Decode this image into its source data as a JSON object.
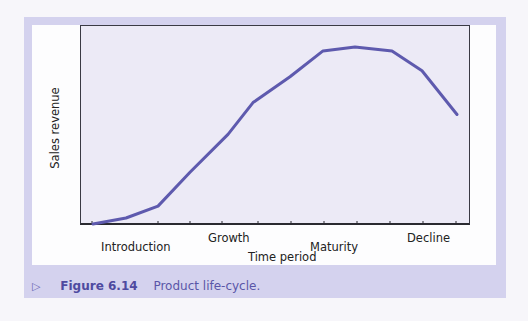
{
  "figure": {
    "number_label": "Figure 6.14",
    "title": "Product life-cycle.",
    "arrow_glyph": "▷"
  },
  "colors": {
    "frame": "#d4d2ee",
    "plot_bg": "#eceaf6",
    "curve": "#5e5aae",
    "caption": "#5a56a8"
  },
  "chart_data": {
    "type": "line",
    "title": "Product life-cycle",
    "xlabel": "Time period",
    "ylabel": "Sales revenue",
    "stages": [
      "Introduction",
      "Growth",
      "Maturity",
      "Decline"
    ],
    "x_ticks_count": 11,
    "grid": false,
    "legend": "none",
    "series": [
      {
        "name": "Sales revenue",
        "x": [
          0,
          1,
          2,
          3,
          4,
          5,
          6,
          7,
          8,
          9,
          10,
          11
        ],
        "values": [
          0,
          3,
          9,
          26,
          45,
          61,
          74,
          87,
          89,
          87,
          77,
          55
        ]
      }
    ],
    "ylim": [
      0,
      100
    ]
  },
  "labels": {
    "ylabel": "Sales revenue",
    "xlabel": "Time period",
    "intro": "Introduction",
    "growth": "Growth",
    "maturity": "Maturity",
    "decline": "Decline"
  }
}
